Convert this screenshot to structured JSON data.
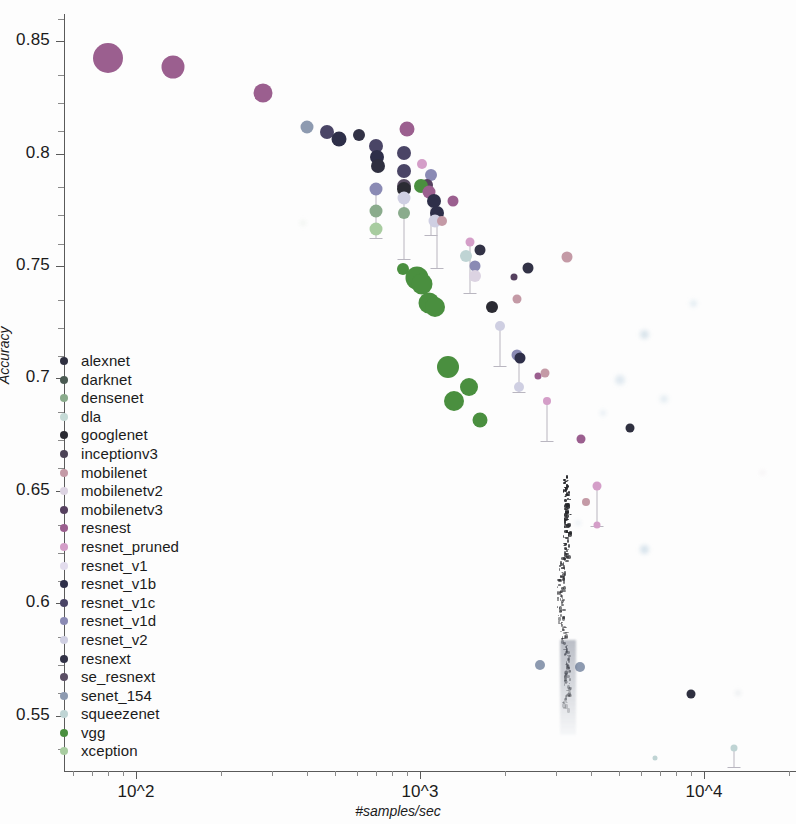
{
  "chart_data": {
    "type": "scatter",
    "title": "",
    "xlabel": "#samples/sec",
    "ylabel": "Accuracy",
    "x_scale": "log10",
    "y_scale": "linear",
    "xlim": [
      60,
      16000
    ],
    "ylim": [
      0.525,
      0.862
    ],
    "x_tick_labels": [
      "10^2",
      "10^3",
      "10^4"
    ],
    "x_tick_values": [
      100,
      1000,
      10000
    ],
    "y_tick_labels": [
      "0.85",
      "0.8",
      "0.75",
      "0.7",
      "0.65",
      "0.6",
      "0.55"
    ],
    "y_tick_values": [
      0.85,
      0.8,
      0.75,
      0.7,
      0.65,
      0.6,
      0.55
    ],
    "grid": false,
    "legend_position": "left-center",
    "note": "Bubble size encodes model size; vertical stems connect related model variants.",
    "series": [
      {
        "name": "alexnet",
        "color": "#2f3040"
      },
      {
        "name": "darknet",
        "color": "#4a5a52"
      },
      {
        "name": "densenet",
        "color": "#8aab8c"
      },
      {
        "name": "dla",
        "color": "#c5dad6"
      },
      {
        "name": "googlenet",
        "color": "#2b2b33"
      },
      {
        "name": "inceptionv3",
        "color": "#4c4356"
      },
      {
        "name": "mobilenet",
        "color": "#c49aa6"
      },
      {
        "name": "mobilenetv2",
        "color": "#dcd3e2"
      },
      {
        "name": "mobilenetv3",
        "color": "#55405f"
      },
      {
        "name": "resnest",
        "color": "#9b5f8f"
      },
      {
        "name": "resnet_pruned",
        "color": "#d49ec8"
      },
      {
        "name": "resnet_v1",
        "color": "#e2dced"
      },
      {
        "name": "resnet_v1b",
        "color": "#2e2f49"
      },
      {
        "name": "resnet_v1c",
        "color": "#4a4566"
      },
      {
        "name": "resnet_v1d",
        "color": "#8a8ab4"
      },
      {
        "name": "resnet_v2",
        "color": "#cfcfe2"
      },
      {
        "name": "resnext",
        "color": "#323246"
      },
      {
        "name": "se_resnext",
        "color": "#5a4e64"
      },
      {
        "name": "senet_154",
        "color": "#8d9ab0"
      },
      {
        "name": "squeezenet",
        "color": "#bfd4d4"
      },
      {
        "name": "vgg",
        "color": "#4a8f3f"
      },
      {
        "name": "xception",
        "color": "#a8cca0"
      }
    ],
    "points": [
      {
        "series": "resnest",
        "x": 80,
        "y": 0.8425,
        "size": 30
      },
      {
        "series": "resnest",
        "x": 135,
        "y": 0.8385,
        "size": 23
      },
      {
        "series": "resnest",
        "x": 280,
        "y": 0.827,
        "size": 19
      },
      {
        "series": "senet_154",
        "x": 400,
        "y": 0.812,
        "size": 13
      },
      {
        "series": "resnet_v1c",
        "x": 470,
        "y": 0.8095,
        "size": 14
      },
      {
        "series": "resnet_v1b",
        "x": 520,
        "y": 0.8065,
        "size": 15
      },
      {
        "series": "resnext",
        "x": 610,
        "y": 0.8085,
        "size": 12
      },
      {
        "series": "resnet_v1c",
        "x": 700,
        "y": 0.8035,
        "size": 14
      },
      {
        "series": "resnet_v1b",
        "x": 705,
        "y": 0.7985,
        "size": 14
      },
      {
        "series": "alexnet",
        "x": 710,
        "y": 0.7945,
        "size": 14
      },
      {
        "series": "resnet_v1d",
        "x": 700,
        "y": 0.7845,
        "size": 13
      },
      {
        "series": "densenet",
        "x": 700,
        "y": 0.7745,
        "size": 13
      },
      {
        "series": "xception",
        "x": 700,
        "y": 0.7665,
        "size": 13
      },
      {
        "series": "resnest",
        "x": 900,
        "y": 0.811,
        "size": 15
      },
      {
        "series": "resnet_v1c",
        "x": 880,
        "y": 0.8005,
        "size": 14
      },
      {
        "series": "resnet_v1c",
        "x": 880,
        "y": 0.7925,
        "size": 14
      },
      {
        "series": "se_resnext",
        "x": 880,
        "y": 0.7855,
        "size": 14
      },
      {
        "series": "googlenet",
        "x": 880,
        "y": 0.7845,
        "size": 14
      },
      {
        "series": "resnet_v2",
        "x": 880,
        "y": 0.7805,
        "size": 13
      },
      {
        "series": "densenet",
        "x": 880,
        "y": 0.7735,
        "size": 12
      },
      {
        "series": "vgg",
        "x": 870,
        "y": 0.7485,
        "size": 12
      },
      {
        "series": "resnet_pruned",
        "x": 1020,
        "y": 0.7955,
        "size": 10
      },
      {
        "series": "resnet_v1d",
        "x": 1090,
        "y": 0.7905,
        "size": 12
      },
      {
        "series": "mobilenetv3",
        "x": 1060,
        "y": 0.786,
        "size": 12
      },
      {
        "series": "vgg",
        "x": 1010,
        "y": 0.7855,
        "size": 14
      },
      {
        "series": "resnest",
        "x": 1075,
        "y": 0.783,
        "size": 13
      },
      {
        "series": "resnet_v1b",
        "x": 1120,
        "y": 0.779,
        "size": 14
      },
      {
        "series": "resnet_v1b",
        "x": 1150,
        "y": 0.7735,
        "size": 14
      },
      {
        "series": "resnet_v2",
        "x": 1130,
        "y": 0.77,
        "size": 13
      },
      {
        "series": "mobilenet",
        "x": 1200,
        "y": 0.77,
        "size": 10
      },
      {
        "series": "resnest",
        "x": 1310,
        "y": 0.779,
        "size": 11
      },
      {
        "series": "squeezenet",
        "x": 1450,
        "y": 0.7545,
        "size": 12
      },
      {
        "series": "resnext",
        "x": 1620,
        "y": 0.757,
        "size": 11
      },
      {
        "series": "resnet_v1d",
        "x": 1560,
        "y": 0.75,
        "size": 11
      },
      {
        "series": "mobilenetv2",
        "x": 1560,
        "y": 0.7455,
        "size": 12
      },
      {
        "series": "resnet_pruned",
        "x": 1500,
        "y": 0.7605,
        "size": 9
      },
      {
        "series": "googlenet",
        "x": 1800,
        "y": 0.732,
        "size": 12
      },
      {
        "series": "resnet_v2",
        "x": 1920,
        "y": 0.7235,
        "size": 10
      },
      {
        "series": "mobilenet",
        "x": 2200,
        "y": 0.7355,
        "size": 9
      },
      {
        "series": "resnext",
        "x": 2400,
        "y": 0.749,
        "size": 11
      },
      {
        "series": "mobilenetv3",
        "x": 2150,
        "y": 0.745,
        "size": 7
      },
      {
        "series": "resnet_v1d",
        "x": 2200,
        "y": 0.7105,
        "size": 11
      },
      {
        "series": "resnet_v1b",
        "x": 2250,
        "y": 0.709,
        "size": 11
      },
      {
        "series": "resnet_v2",
        "x": 2230,
        "y": 0.696,
        "size": 10
      },
      {
        "series": "resnest",
        "x": 2600,
        "y": 0.701,
        "size": 7
      },
      {
        "series": "mobilenet",
        "x": 2750,
        "y": 0.7025,
        "size": 9
      },
      {
        "series": "resnet_pruned",
        "x": 2800,
        "y": 0.69,
        "size": 8
      },
      {
        "series": "vgg",
        "x": 975,
        "y": 0.7445,
        "size": 23
      },
      {
        "series": "vgg",
        "x": 1015,
        "y": 0.742,
        "size": 21
      },
      {
        "series": "vgg",
        "x": 1080,
        "y": 0.7335,
        "size": 21
      },
      {
        "series": "vgg",
        "x": 1130,
        "y": 0.732,
        "size": 20
      },
      {
        "series": "vgg",
        "x": 1250,
        "y": 0.705,
        "size": 22
      },
      {
        "series": "vgg",
        "x": 1490,
        "y": 0.696,
        "size": 18
      },
      {
        "series": "vgg",
        "x": 1320,
        "y": 0.69,
        "size": 20
      },
      {
        "series": "vgg",
        "x": 1620,
        "y": 0.6815,
        "size": 15
      },
      {
        "series": "mobilenet",
        "x": 3300,
        "y": 0.754,
        "size": 11
      },
      {
        "series": "resnest",
        "x": 3700,
        "y": 0.673,
        "size": 9
      },
      {
        "series": "resnet_pruned",
        "x": 4200,
        "y": 0.652,
        "size": 9
      },
      {
        "series": "resnet_pruned",
        "x": 4200,
        "y": 0.635,
        "size": 7
      },
      {
        "series": "mobilenet",
        "x": 3850,
        "y": 0.645,
        "size": 8
      },
      {
        "series": "alexnet",
        "x": 5500,
        "y": 0.678,
        "size": 9
      },
      {
        "series": "senet_154",
        "x": 2650,
        "y": 0.5725,
        "size": 10
      },
      {
        "series": "senet_154",
        "x": 3650,
        "y": 0.5715,
        "size": 10
      },
      {
        "series": "alexnet",
        "x": 9000,
        "y": 0.5595,
        "size": 9
      },
      {
        "series": "squeezenet",
        "x": 12800,
        "y": 0.5355,
        "size": 7
      },
      {
        "series": "squeezenet",
        "x": 6700,
        "y": 0.531,
        "size": 5
      }
    ],
    "stems": [
      {
        "x": 700,
        "y_top": 0.7845,
        "y_bottom": 0.7625
      },
      {
        "x": 880,
        "y_top": 0.7805,
        "y_bottom": 0.753
      },
      {
        "x": 1090,
        "y_top": 0.7905,
        "y_bottom": 0.764
      },
      {
        "x": 1150,
        "y_top": 0.7735,
        "y_bottom": 0.749
      },
      {
        "x": 1500,
        "y_top": 0.76,
        "y_bottom": 0.738
      },
      {
        "x": 1920,
        "y_top": 0.7235,
        "y_bottom": 0.7055
      },
      {
        "x": 2230,
        "y_top": 0.709,
        "y_bottom": 0.694
      },
      {
        "x": 2800,
        "y_top": 0.69,
        "y_bottom": 0.672
      },
      {
        "x": 4200,
        "y_top": 0.652,
        "y_bottom": 0.6345
      },
      {
        "x": 12800,
        "y_top": 0.536,
        "y_bottom": 0.527
      }
    ]
  },
  "legend": {
    "items": [
      {
        "label": "alexnet"
      },
      {
        "label": "darknet"
      },
      {
        "label": "densenet"
      },
      {
        "label": "dla"
      },
      {
        "label": "googlenet"
      },
      {
        "label": "inceptionv3"
      },
      {
        "label": "mobilenet"
      },
      {
        "label": "mobilenetv2"
      },
      {
        "label": "mobilenetv3"
      },
      {
        "label": "resnest"
      },
      {
        "label": "resnet_pruned"
      },
      {
        "label": "resnet_v1"
      },
      {
        "label": "resnet_v1b"
      },
      {
        "label": "resnet_v1c"
      },
      {
        "label": "resnet_v1d"
      },
      {
        "label": "resnet_v2"
      },
      {
        "label": "resnext"
      },
      {
        "label": "se_resnext"
      },
      {
        "label": "senet_154"
      },
      {
        "label": "squeezenet"
      },
      {
        "label": "vgg"
      },
      {
        "label": "xception"
      }
    ]
  }
}
